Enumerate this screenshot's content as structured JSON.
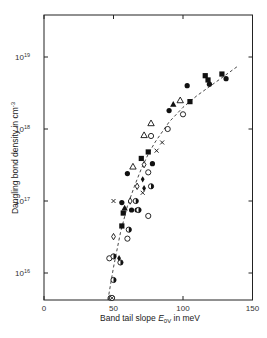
{
  "chart_data": {
    "type": "scatter",
    "title": "",
    "xlabel": "Band tail slope E0V in meV",
    "xlabel_parts": {
      "pre": "Band tail slope ",
      "symbol": "E",
      "sub": "0V",
      "post": " in meV"
    },
    "ylabel": "Dangling bond density in cm-3",
    "ylabel_parts": {
      "pre": "Dangling bond density in cm",
      "sup": "-3"
    },
    "xlim": [
      0,
      150
    ],
    "ylim": [
      4000000000000000.0,
      3.8e+19
    ],
    "yscale": "log",
    "grid": false,
    "legend": null,
    "x_ticks": [
      0,
      50,
      100,
      150
    ],
    "y_ticks": [
      {
        "value": 1e+16,
        "base": "10",
        "exp": "16"
      },
      {
        "value": 1e+17,
        "base": "10",
        "exp": "17"
      },
      {
        "value": 1e+18,
        "base": "10",
        "exp": "18"
      },
      {
        "value": 1e+19,
        "base": "10",
        "exp": "19"
      }
    ],
    "series": [
      {
        "name": "filled-circle",
        "marker": "circle-filled",
        "points": [
          [
            56,
            9.5e+16
          ],
          [
            60,
            2.4e+17
          ],
          [
            63,
            7.5e+16
          ],
          [
            67,
            7.5e+16
          ],
          [
            78,
            3.3e+17
          ],
          [
            90,
            1.8e+18
          ],
          [
            103,
            4e+18
          ],
          [
            119,
            4.2e+18
          ],
          [
            131,
            5e+18
          ]
        ]
      },
      {
        "name": "filled-square",
        "marker": "square-filled",
        "points": [
          [
            56,
            4.5e+16
          ],
          [
            57,
            6.8e+16
          ],
          [
            70,
            3.9e+17
          ],
          [
            75,
            4.8e+17
          ],
          [
            105,
            2.4e+18
          ],
          [
            116,
            5.5e+18
          ],
          [
            118,
            4.8e+18
          ],
          [
            128,
            5.8e+18
          ]
        ]
      },
      {
        "name": "open-triangle",
        "marker": "triangle-open",
        "points": [
          [
            64,
            3e+17
          ],
          [
            72,
            8.2e+17
          ],
          [
            77,
            1.2e+18
          ],
          [
            98,
            2.5e+18
          ]
        ]
      },
      {
        "name": "filled-triangle",
        "marker": "triangle-filled",
        "points": [
          [
            58,
            8e+16
          ],
          [
            93,
            2.2e+18
          ]
        ]
      },
      {
        "name": "open-circle",
        "marker": "circle-open",
        "points": [
          [
            47,
            1.6e+16
          ],
          [
            60,
            3e+16
          ],
          [
            75,
            2.5e+17
          ],
          [
            77,
            8e+17
          ],
          [
            75,
            6.2e+16
          ],
          [
            89,
            1e+18
          ],
          [
            100,
            1.6e+18
          ]
        ]
      },
      {
        "name": "cross",
        "marker": "x",
        "points": [
          [
            50,
            1e+17
          ],
          [
            71,
            1.3e+17
          ],
          [
            81,
            5e+17
          ],
          [
            85,
            6.5e+17
          ]
        ]
      },
      {
        "name": "open-diamond",
        "marker": "diamond-open",
        "points": [
          [
            50,
            3.2e+16
          ],
          [
            62,
            1e+17
          ],
          [
            67,
            1.6e+17
          ],
          [
            72,
            3.2e+17
          ]
        ]
      },
      {
        "name": "filled-diamond",
        "marker": "diamond-filled",
        "points": [
          [
            71,
            2e+17
          ],
          [
            72,
            1.5e+17
          ],
          [
            54,
            1.6e+16
          ]
        ]
      },
      {
        "name": "half-filled-circle",
        "marker": "circle-half",
        "points": [
          [
            50,
            1.7e+16
          ],
          [
            50,
            8000000000000000.0
          ],
          [
            55,
            1.4e+16
          ],
          [
            61,
            4e+16
          ],
          [
            66,
            1e+17
          ],
          [
            68,
            7.5e+16
          ],
          [
            77,
            1.6e+17
          ]
        ]
      },
      {
        "name": "hatched-circle",
        "marker": "circle-hatched",
        "points": [
          [
            48,
            4500000000000000.0
          ],
          [
            49,
            4500000000000000.0
          ]
        ]
      }
    ],
    "fit_curve": {
      "style": "dashed",
      "points": [
        [
          46,
          4000000000000000.0
        ],
        [
          50,
          1.2e+16
        ],
        [
          55,
          3.6e+16
        ],
        [
          60,
          8.5e+16
        ],
        [
          65,
          1.6e+17
        ],
        [
          70,
          2.8e+17
        ],
        [
          75,
          4.5e+17
        ],
        [
          80,
          6.6e+17
        ],
        [
          90,
          1.25e+18
        ],
        [
          100,
          2e+18
        ],
        [
          110,
          2.9e+18
        ],
        [
          120,
          4e+18
        ],
        [
          130,
          5.5e+18
        ],
        [
          140,
          7.6e+18
        ]
      ]
    }
  }
}
